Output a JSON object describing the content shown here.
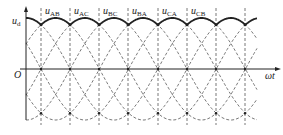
{
  "figure": {
    "y_axis_label": "u",
    "y_axis_label_sub": "d",
    "origin_label": "O",
    "x_axis_label": "ωt",
    "line_color": "#333333",
    "envelope_color": "#222222",
    "caption_visible": false
  },
  "chart_data": {
    "type": "line",
    "title": "",
    "xlabel": "ωt",
    "ylabel": "u_d",
    "segment_labels": [
      {
        "main": "u",
        "sub": "AB"
      },
      {
        "main": "u",
        "sub": "AC"
      },
      {
        "main": "u",
        "sub": "BC"
      },
      {
        "main": "u",
        "sub": "BA"
      },
      {
        "main": "u",
        "sub": "CA"
      },
      {
        "main": "u",
        "sub": "CB"
      }
    ],
    "phase_spacing_deg": 60,
    "commutation_x_px": [
      41,
      70,
      99,
      128,
      158,
      187,
      216,
      245
    ],
    "geometry": {
      "origin_x": 26,
      "axis_y": 69,
      "amplitude_px": 51,
      "x_start": 26,
      "x_end": 257,
      "axis_x_end": 279,
      "y_axis_top": 9,
      "y_axis_bottom": 120,
      "period_px": 175.2
    },
    "envelope": "max of six line voltages (peaks at top, crossings at ~cos30° of peak)"
  }
}
